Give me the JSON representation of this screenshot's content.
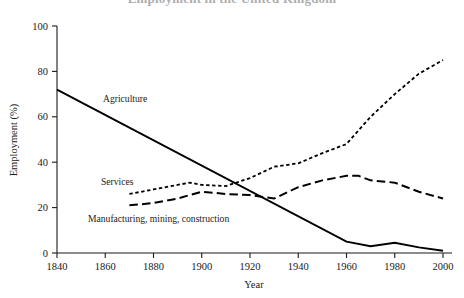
{
  "figure": {
    "cut_off_title": "Employment in the United Kingdom",
    "background_color": "#ffffff",
    "line_color": "#000000"
  },
  "axes": {
    "x": {
      "title": "Year",
      "tick_labels": [
        "1840",
        "1860",
        "1880",
        "1900",
        "1920",
        "1940",
        "1960",
        "1980",
        "2000"
      ],
      "min": 1840,
      "max": 2000
    },
    "y": {
      "title": "Employment (%)",
      "tick_labels": [
        "0",
        "20",
        "40",
        "60",
        "80",
        "100"
      ],
      "min": 0,
      "max": 100
    }
  },
  "series_labels": {
    "agriculture": "Agriculture",
    "services": "Services",
    "manufacturing": "Manufacturing, mining, construction"
  },
  "chart_data": {
    "type": "line",
    "title": "Employment in the United Kingdom",
    "xlabel": "Year",
    "ylabel": "Employment (%)",
    "xlim": [
      1840,
      2000
    ],
    "ylim": [
      0,
      100
    ],
    "xticks": [
      1840,
      1860,
      1880,
      1900,
      1920,
      1940,
      1960,
      1980,
      2000
    ],
    "yticks": [
      0,
      20,
      40,
      60,
      80,
      100
    ],
    "grid": false,
    "legend": "inline-labels",
    "series": [
      {
        "name": "Agriculture",
        "linestyle": "solid",
        "x": [
          1840,
          1960,
          1970,
          1980,
          1990,
          2000
        ],
        "values": [
          72,
          5,
          3,
          4.5,
          2.5,
          1
        ]
      },
      {
        "name": "Services",
        "linestyle": "dotted",
        "x": [
          1870,
          1880,
          1890,
          1895,
          1900,
          1910,
          1920,
          1930,
          1940,
          1950,
          1960,
          1970,
          1980,
          1990,
          2000
        ],
        "values": [
          26,
          28,
          30,
          31,
          30,
          29.5,
          33,
          38,
          39.5,
          44,
          48,
          60,
          70,
          79,
          85
        ]
      },
      {
        "name": "Manufacturing, mining, construction",
        "linestyle": "dashed",
        "x": [
          1870,
          1880,
          1890,
          1900,
          1910,
          1920,
          1930,
          1940,
          1950,
          1960,
          1965,
          1970,
          1980,
          1990,
          2000
        ],
        "values": [
          21,
          22,
          24,
          27,
          26,
          25.5,
          24,
          29,
          32,
          34,
          34,
          32,
          31,
          27,
          24
        ]
      }
    ]
  }
}
